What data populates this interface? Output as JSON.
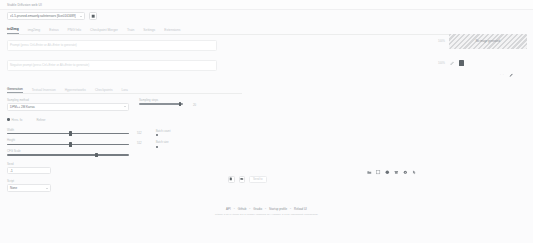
{
  "header": {
    "app_title": "Stable Diffusion web UI",
    "model_label": "Stable Diffusion checkpoint",
    "model_value": "v1-5-pruned-emaonly.safetensors [6ce0161689]",
    "refresh_icon": "refresh-icon"
  },
  "tabs": [
    {
      "label": "txt2img",
      "active": true
    },
    {
      "label": "img2img",
      "active": false
    },
    {
      "label": "Extras",
      "active": false
    },
    {
      "label": "PNG Info",
      "active": false
    },
    {
      "label": "Checkpoint Merger",
      "active": false
    },
    {
      "label": "Train",
      "active": false
    },
    {
      "label": "Settings",
      "active": false
    },
    {
      "label": "Extensions",
      "active": false
    }
  ],
  "prompt": {
    "placeholder": "Prompt (press Ctrl+Enter or Alt+Enter to generate)",
    "value": "",
    "negative_placeholder": "Negative prompt (press Ctrl+Enter or Alt+Enter to generate)",
    "negative_value": ""
  },
  "subtabs": [
    {
      "label": "Generation",
      "active": true
    },
    {
      "label": "Textual Inversion",
      "active": false
    },
    {
      "label": "Hypernetworks",
      "active": false
    },
    {
      "label": "Checkpoints",
      "active": false
    },
    {
      "label": "Lora",
      "active": false
    }
  ],
  "params": {
    "sampler_label": "Sampling method",
    "sampler_value": "DPM++ 2M Karras",
    "steps_label": "Sampling steps",
    "steps_value": "20",
    "hires_label": "Hires. fix",
    "hires_checked": false,
    "refiner_label": "Refiner",
    "width_label": "Width",
    "width_value": "512",
    "height_label": "Height",
    "height_value": "512",
    "batch_count_label": "Batch count",
    "batch_count_value": "1",
    "batch_size_label": "Batch size",
    "batch_size_value": "1",
    "cfg_label": "CFG Scale",
    "cfg_value": "7",
    "seed_label": "Seed",
    "seed_value": "-1",
    "script_label": "Script",
    "script_value": "None"
  },
  "actions": {
    "save_icon": "save-icon",
    "zip_icon": "zip-folder-icon",
    "send_label": "Send to"
  },
  "gallery": {
    "row1_label": "100%",
    "image_caption": "No image generated",
    "row2_label": "100%",
    "edit_icon": "pencil-icon",
    "delete_icon": "trash-icon",
    "dots_label": "· ·",
    "brush_icon": "brush-icon"
  },
  "toolbar_icons": [
    "folder-open-icon",
    "save-image-icon",
    "palette-icon",
    "archive-icon",
    "settings-gear-icon",
    "cursor-arrow-icon"
  ],
  "footer": {
    "links": [
      "API",
      "Github",
      "Gradio",
      "Startup profile",
      "Reload UI"
    ],
    "separator": "•",
    "meta": "python: 3.10.6  •  torch: 2.0.1+cu118  •  xformers: N/A  •  gradio: 3.41.2  •  checkpoint: 6ce0161689"
  }
}
